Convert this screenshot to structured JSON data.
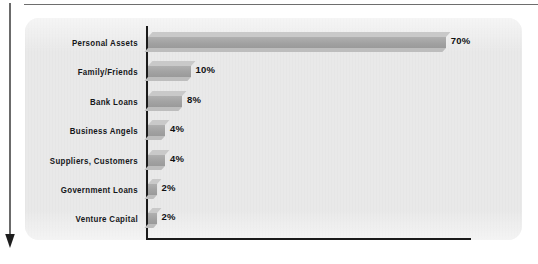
{
  "figure": {
    "panel_background": "#e9e9e9",
    "bar_color": "#a5a5a5",
    "bar_top_color": "#c9c9c9",
    "axis_color": "#1b1b1b"
  },
  "flow_arrow": {
    "name": "downward-flow-arrow",
    "direction": "down",
    "color": "#2b2b2b"
  },
  "chart_data": {
    "type": "bar",
    "orientation": "horizontal",
    "title": "",
    "subtitle": "",
    "xlabel": "",
    "ylabel": "",
    "grid": false,
    "legend": false,
    "xlim": [
      0,
      75
    ],
    "value_suffix": "%",
    "categories": [
      "Personal Assets",
      "Family/Friends",
      "Bank Loans",
      "Business Angels",
      "Suppliers, Customers",
      "Government Loans",
      "Venture Capital"
    ],
    "values": [
      70,
      10,
      8,
      4,
      4,
      2,
      2
    ],
    "value_labels": [
      "70%",
      "10%",
      "8%",
      "4%",
      "4%",
      "2%",
      "2%"
    ]
  }
}
